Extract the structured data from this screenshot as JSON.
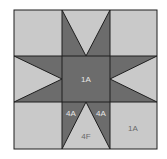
{
  "diagram": {
    "type": "quilt-block",
    "colors": {
      "light": "#c9c9c9",
      "dark": "#6c6c6c",
      "line": "#1e1e1e",
      "label_on_dark": "#e6e6e6",
      "label_on_light": "#6a6a6a"
    },
    "labels": {
      "center": "1A",
      "bottom_left_star_point": "4A",
      "bottom_right_star_point": "4A",
      "bottom_background_triangle": "4F",
      "bottom_right_corner": "1A"
    }
  }
}
